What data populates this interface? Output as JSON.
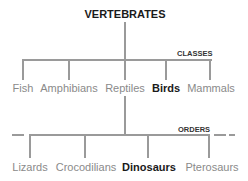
{
  "title": "VERTEBRATES",
  "levels": {
    "classes_label": "CLASSES",
    "orders_label": "ORDERS"
  },
  "classes": [
    {
      "label": "Fish",
      "highlighted": false
    },
    {
      "label": "Amphibians",
      "highlighted": false
    },
    {
      "label": "Reptiles",
      "highlighted": false
    },
    {
      "label": "Birds",
      "highlighted": true
    },
    {
      "label": "Mammals",
      "highlighted": false
    }
  ],
  "orders": [
    {
      "label": "Lizards",
      "highlighted": false
    },
    {
      "label": "Crocodilians",
      "highlighted": false
    },
    {
      "label": "Dinosaurs",
      "highlighted": true
    },
    {
      "label": "Pterosaurs",
      "highlighted": false
    }
  ],
  "colors": {
    "line": "#9a9a9a",
    "muted_text": "#8a8a8a",
    "highlight_text": "#1a1a1a"
  }
}
